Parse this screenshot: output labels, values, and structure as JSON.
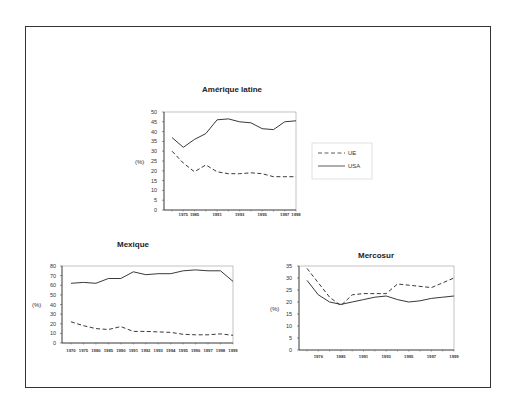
{
  "chart_data": [
    {
      "type": "line",
      "title": "Amérique latine",
      "xlabel": "",
      "ylabel": "(%)",
      "ylim": [
        0,
        50
      ],
      "yticks": [
        0,
        5,
        10,
        15,
        20,
        25,
        30,
        35,
        40,
        45,
        50
      ],
      "grid": false,
      "legend_position": "right",
      "x": [
        "",
        "1975",
        "1985",
        "",
        "1991",
        "",
        "1993",
        "",
        "1995",
        "",
        "1997",
        "1998"
      ],
      "xtick_labels": [
        "1975",
        "1985",
        "1991",
        "1993",
        "1995",
        "1997",
        "1998"
      ],
      "series": [
        {
          "name": "UE",
          "style": "dashed",
          "values": [
            30,
            24,
            19.5,
            23,
            19.5,
            18.5,
            18.5,
            19,
            18.5,
            17,
            17,
            17
          ]
        },
        {
          "name": "USA",
          "style": "solid",
          "values": [
            37,
            32,
            36,
            39,
            46,
            46.5,
            45,
            44.5,
            41.5,
            41,
            45,
            45.5
          ]
        }
      ]
    },
    {
      "type": "line",
      "title": "Mexique",
      "xlabel": "",
      "ylabel": "(%)",
      "ylim": [
        0,
        80
      ],
      "yticks": [
        0,
        10,
        20,
        30,
        40,
        50,
        60,
        70,
        80
      ],
      "grid": false,
      "x": [
        "1970",
        "1975",
        "1980",
        "1985",
        "1990",
        "1991",
        "1992",
        "1993",
        "1994",
        "1995",
        "1996",
        "1997",
        "1998",
        "1999"
      ],
      "xtick_labels": [
        "1970",
        "1975",
        "1980",
        "1985",
        "1990",
        "1991",
        "1992",
        "1993",
        "1994",
        "1995",
        "1996",
        "1997",
        "1998",
        "1999"
      ],
      "series": [
        {
          "name": "UE",
          "style": "dashed",
          "values": [
            22,
            18,
            15,
            14,
            17,
            12,
            12,
            11.5,
            11,
            9,
            8.5,
            8.5,
            9.5,
            8
          ]
        },
        {
          "name": "USA",
          "style": "solid",
          "values": [
            62,
            63,
            62,
            67,
            67,
            74,
            71,
            72,
            72,
            75,
            76,
            75,
            75,
            64
          ]
        }
      ]
    },
    {
      "type": "line",
      "title": "Mercosur",
      "xlabel": "",
      "ylabel": "(%)",
      "ylim": [
        0,
        35
      ],
      "yticks": [
        0,
        5,
        10,
        15,
        20,
        25,
        30,
        35
      ],
      "grid": false,
      "x": [
        "",
        "1976",
        "",
        "1985",
        "",
        "1991",
        "",
        "1993",
        "",
        "1995",
        "",
        "1997",
        "",
        "1999"
      ],
      "xtick_labels": [
        "1976",
        "1985",
        "1991",
        "1993",
        "1995",
        "1997",
        "1999"
      ],
      "series": [
        {
          "name": "UE",
          "style": "dashed",
          "values": [
            34,
            28,
            22,
            18.5,
            23,
            23.5,
            23.5,
            23.5,
            27.5,
            27,
            26.5,
            26,
            28,
            30
          ]
        },
        {
          "name": "USA",
          "style": "solid",
          "values": [
            29,
            23,
            20,
            19,
            20,
            21,
            22,
            22.5,
            21,
            20,
            20.5,
            21.5,
            22,
            22.5
          ]
        }
      ]
    }
  ],
  "legend": {
    "items": [
      {
        "label": "UE",
        "style": "dashed"
      },
      {
        "label": "USA",
        "style": "solid"
      }
    ]
  }
}
